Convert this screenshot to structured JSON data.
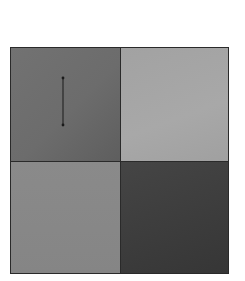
{
  "figure": {
    "type": "2x2-grayscale-grid",
    "quadrants": [
      {
        "position": "top-left",
        "color": "#6e6e6e",
        "has_marker": true
      },
      {
        "position": "top-right",
        "color": "#a4a4a4",
        "has_marker": false
      },
      {
        "position": "bottom-left",
        "color": "#888888",
        "has_marker": false
      },
      {
        "position": "bottom-right",
        "color": "#3e3e3e",
        "has_marker": false
      }
    ],
    "marker": {
      "shape": "vertical-line-segment-with-endpoints",
      "color": "#1a1a1a",
      "x1": 63,
      "y1": 78,
      "x2": 63,
      "y2": 125
    },
    "border_color": "#2a2a2a"
  }
}
